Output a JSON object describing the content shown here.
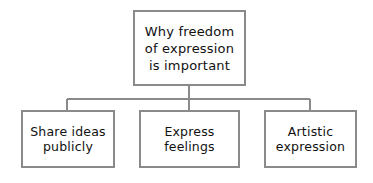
{
  "diagram": {
    "type": "hierarchy-tree",
    "orientation": "top-down",
    "background_color": "#ffffff",
    "border_color": "#8a8a8a",
    "connector_color": "#8a8a8a",
    "text_color": "#111111",
    "root": {
      "label": "Why freedom\nof expression\nis important"
    },
    "children": [
      {
        "label": "Share ideas\npublicly"
      },
      {
        "label": "Express\nfeelings"
      },
      {
        "label": "Artistic\nexpression"
      }
    ]
  }
}
